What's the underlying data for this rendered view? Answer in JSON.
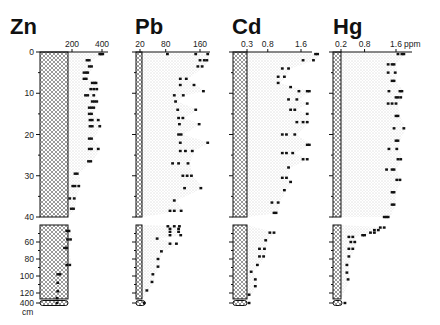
{
  "chart_data": {
    "type": "scatter",
    "title": "",
    "ylabel": "Depth (cm)",
    "y_axis": {
      "upper_section": {
        "range": [
          0,
          40
        ],
        "ticks": [
          0,
          10,
          20,
          30,
          40
        ],
        "minor_step": 5
      },
      "lower_section": {
        "range": [
          40,
          120
        ],
        "ticks": [
          60,
          80,
          100,
          120
        ],
        "minor_step": 10
      },
      "bottom_sample": {
        "depth": 400,
        "label": "400",
        "unit": "cm"
      }
    },
    "panels": [
      {
        "element": "Zn",
        "x_ticks": [
          "200",
          "400"
        ],
        "x_tick_values": [
          200,
          400
        ],
        "xlim": [
          0,
          420
        ],
        "background": 90,
        "points": [
          {
            "depth": 0.5,
            "values": [
              385,
              395,
              405
            ]
          },
          {
            "depth": 2,
            "values": [
              300,
              315
            ]
          },
          {
            "depth": 3.5,
            "values": [
              315,
              330
            ]
          },
          {
            "depth": 5,
            "values": [
              280,
              295,
              305
            ]
          },
          {
            "depth": 6.5,
            "values": [
              280,
              295
            ]
          },
          {
            "depth": 7.5,
            "values": [
              335,
              350,
              360
            ]
          },
          {
            "depth": 9,
            "values": [
              325,
              345,
              365
            ]
          },
          {
            "depth": 10.5,
            "values": [
              290,
              305,
              345
            ]
          },
          {
            "depth": 12,
            "values": [
              335,
              350,
              365
            ]
          },
          {
            "depth": 13.5,
            "values": [
              315,
              330,
              345
            ]
          },
          {
            "depth": 15,
            "values": [
              315,
              330
            ]
          },
          {
            "depth": 16.5,
            "values": [
              320,
              335,
              375
            ]
          },
          {
            "depth": 18,
            "values": [
              320,
              335,
              385
            ]
          },
          {
            "depth": 21,
            "values": [
              315,
              330
            ]
          },
          {
            "depth": 23.5,
            "values": [
              315,
              330,
              375
            ]
          },
          {
            "depth": 26.5,
            "values": [
              310,
              325
            ]
          },
          {
            "depth": 29.5,
            "values": [
              220,
              235
            ]
          },
          {
            "depth": 32.5,
            "values": [
              205,
              220,
              245
            ]
          },
          {
            "depth": 35.5,
            "values": [
              185,
              215
            ]
          },
          {
            "depth": 38,
            "values": [
              195,
              210
            ]
          },
          {
            "depth": 47,
            "values": [
              165,
              180
            ]
          },
          {
            "depth": 57,
            "values": [
              170,
              190
            ]
          },
          {
            "depth": 67,
            "values": [
              150,
              165
            ]
          },
          {
            "depth": 87,
            "values": [
              165,
              185
            ]
          },
          {
            "depth": 98,
            "values": [
              105,
              120
            ]
          },
          {
            "depth": 108,
            "values": [
              105
            ]
          },
          {
            "depth": 118,
            "values": [
              105
            ]
          },
          {
            "depth": 126,
            "values": [
              100
            ]
          },
          {
            "depth": 400,
            "values": [
              100
            ]
          }
        ]
      },
      {
        "element": "Pb",
        "x_ticks": [
          "20",
          "80",
          "160"
        ],
        "x_tick_values": [
          20,
          80,
          160
        ],
        "xlim": [
          0,
          190
        ],
        "background": 20,
        "points": [
          {
            "depth": 0.5,
            "values": [
              84,
              150,
              178
            ]
          },
          {
            "depth": 2,
            "values": [
              160,
              170,
              176
            ]
          },
          {
            "depth": 3.5,
            "values": [
              155,
              165
            ]
          },
          {
            "depth": 6.5,
            "values": [
              114,
              128
            ]
          },
          {
            "depth": 8,
            "values": [
              114,
              146
            ]
          },
          {
            "depth": 9.5,
            "values": [
              168
            ]
          },
          {
            "depth": 10.5,
            "values": [
              100,
              121
            ]
          },
          {
            "depth": 12,
            "values": [
              103
            ]
          },
          {
            "depth": 14,
            "values": [
              108,
              150
            ]
          },
          {
            "depth": 16,
            "values": [
              110,
              120
            ]
          },
          {
            "depth": 17.5,
            "values": [
              112,
              158
            ]
          },
          {
            "depth": 20,
            "values": [
              110,
              116
            ]
          },
          {
            "depth": 22,
            "values": [
              114,
              178
            ]
          },
          {
            "depth": 24,
            "values": [
              114,
              126,
              142
            ]
          },
          {
            "depth": 27,
            "values": [
              96,
              110,
              132
            ]
          },
          {
            "depth": 30,
            "values": [
              120,
              130,
              140
            ]
          },
          {
            "depth": 33,
            "values": [
              124,
              162
            ]
          },
          {
            "depth": 36,
            "values": [
              100
            ]
          },
          {
            "depth": 38.5,
            "values": [
              90,
              100,
              116
            ]
          },
          {
            "depth": 41.5,
            "values": [
              85,
              100,
              112
            ]
          },
          {
            "depth": 44.5,
            "values": [
              90,
              110
            ]
          },
          {
            "depth": 48,
            "values": [
              90,
              110
            ]
          },
          {
            "depth": 52,
            "values": [
              90,
              115
            ]
          },
          {
            "depth": 56,
            "values": [
              60
            ]
          },
          {
            "depth": 62,
            "values": [
              90,
              105
            ]
          },
          {
            "depth": 71,
            "values": [
              70
            ]
          },
          {
            "depth": 80,
            "values": [
              62
            ]
          },
          {
            "depth": 89,
            "values": [
              62
            ]
          },
          {
            "depth": 98,
            "values": [
              50
            ]
          },
          {
            "depth": 107,
            "values": [
              48
            ]
          },
          {
            "depth": 117,
            "values": [
              36
            ]
          },
          {
            "depth": 400,
            "values": [
              30
            ]
          }
        ]
      },
      {
        "element": "Cd",
        "x_ticks": [
          "0.3",
          "0.8",
          "1.6"
        ],
        "x_tick_values": [
          0.3,
          0.8,
          1.6
        ],
        "xlim": [
          0,
          2.0
        ],
        "background": 0.3,
        "points": [
          {
            "depth": 0.5,
            "values": [
              1.95,
              2.0
            ]
          },
          {
            "depth": 2,
            "values": [
              1.65,
              1.9
            ]
          },
          {
            "depth": 4,
            "values": [
              1.15,
              1.3
            ]
          },
          {
            "depth": 6,
            "values": [
              1.05,
              1.2
            ]
          },
          {
            "depth": 7.5,
            "values": [
              1.05
            ]
          },
          {
            "depth": 8.5,
            "values": [
              1.35
            ]
          },
          {
            "depth": 9.5,
            "values": [
              1.55,
              1.75,
              1.8
            ]
          },
          {
            "depth": 11.5,
            "values": [
              1.3,
              1.5
            ]
          },
          {
            "depth": 12.5,
            "values": [
              1.75
            ]
          },
          {
            "depth": 14,
            "values": [
              1.35,
              1.45
            ]
          },
          {
            "depth": 15,
            "values": [
              1.75
            ]
          },
          {
            "depth": 17,
            "values": [
              1.5,
              1.65,
              1.75
            ]
          },
          {
            "depth": 20,
            "values": [
              1.15,
              1.25,
              1.45
            ]
          },
          {
            "depth": 22.5,
            "values": [
              1.75,
              1.8
            ]
          },
          {
            "depth": 24.5,
            "values": [
              1.15,
              1.25,
              1.4
            ]
          },
          {
            "depth": 26,
            "values": [
              1.65,
              1.75
            ]
          },
          {
            "depth": 28,
            "values": [
              1.3
            ]
          },
          {
            "depth": 30.5,
            "values": [
              1.15,
              1.25
            ]
          },
          {
            "depth": 31.5,
            "values": [
              1.35
            ]
          },
          {
            "depth": 33.5,
            "values": [
              1.2
            ]
          },
          {
            "depth": 36.5,
            "values": [
              0.9,
              1.05
            ]
          },
          {
            "depth": 39,
            "values": [
              0.95,
              1.0
            ]
          },
          {
            "depth": 49,
            "values": [
              0.85,
              0.95
            ]
          },
          {
            "depth": 58,
            "values": [
              0.75
            ]
          },
          {
            "depth": 68,
            "values": [
              0.6,
              0.72
            ]
          },
          {
            "depth": 77,
            "values": [
              0.6,
              0.7
            ]
          },
          {
            "depth": 87,
            "values": [
              0.55
            ]
          },
          {
            "depth": 95,
            "values": [
              0.4
            ]
          },
          {
            "depth": 104,
            "values": [
              0.5
            ]
          },
          {
            "depth": 112,
            "values": [
              0.5
            ]
          },
          {
            "depth": 122,
            "values": [
              0.35
            ]
          },
          {
            "depth": 400,
            "values": [
              0.35
            ]
          }
        ]
      },
      {
        "element": "Hg",
        "x_ticks": [
          "0.2",
          "0.8",
          "1.6"
        ],
        "x_unit": "ppm",
        "x_tick_values": [
          0.2,
          0.8,
          1.6
        ],
        "xlim": [
          0,
          1.9
        ],
        "background": 0.2,
        "points": [
          {
            "depth": 0.5,
            "values": [
              1.65,
              1.75,
              1.8
            ]
          },
          {
            "depth": 3,
            "values": [
              1.4,
              1.5,
              1.55
            ]
          },
          {
            "depth": 5,
            "values": [
              1.4,
              1.58
            ]
          },
          {
            "depth": 7,
            "values": [
              1.5,
              1.55
            ]
          },
          {
            "depth": 9.5,
            "values": [
              1.42,
              1.7,
              1.75
            ]
          },
          {
            "depth": 11,
            "values": [
              1.6,
              1.65,
              1.72
            ]
          },
          {
            "depth": 12.5,
            "values": [
              1.4,
              1.5,
              1.6
            ]
          },
          {
            "depth": 15.5,
            "values": [
              1.6,
              1.65
            ]
          },
          {
            "depth": 18.5,
            "values": [
              1.55,
              1.8
            ]
          },
          {
            "depth": 21.5,
            "values": [
              1.6,
              1.65
            ]
          },
          {
            "depth": 23.5,
            "values": [
              1.42,
              1.62
            ]
          },
          {
            "depth": 26,
            "values": [
              1.65,
              1.72
            ]
          },
          {
            "depth": 28.5,
            "values": [
              1.36,
              1.5,
              1.55
            ]
          },
          {
            "depth": 31,
            "values": [
              1.62,
              1.7
            ]
          },
          {
            "depth": 34,
            "values": [
              1.5,
              1.55
            ]
          },
          {
            "depth": 37,
            "values": [
              1.5,
              1.55
            ]
          },
          {
            "depth": 40,
            "values": [
              1.3,
              1.35,
              1.4
            ]
          },
          {
            "depth": 43,
            "values": [
              1.2,
              1.3
            ]
          },
          {
            "depth": 46,
            "values": [
              1.05,
              1.15
            ]
          },
          {
            "depth": 49,
            "values": [
              0.95,
              1.05
            ]
          },
          {
            "depth": 52,
            "values": [
              0.75,
              0.8
            ]
          },
          {
            "depth": 54,
            "values": [
              0.4,
              0.5
            ]
          },
          {
            "depth": 60,
            "values": [
              0.45,
              0.55
            ]
          },
          {
            "depth": 68,
            "values": [
              0.4,
              0.5
            ]
          },
          {
            "depth": 77,
            "values": [
              0.4
            ]
          },
          {
            "depth": 87,
            "values": [
              0.35
            ]
          },
          {
            "depth": 96,
            "values": [
              0.35
            ]
          },
          {
            "depth": 104,
            "values": [
              0.38
            ]
          },
          {
            "depth": 400,
            "values": [
              0.3
            ]
          }
        ]
      }
    ],
    "layout": {
      "grid": false,
      "legend": "none",
      "x_axis_position": "top",
      "y_axis_inverted": true
    }
  },
  "labels": {
    "depth_ticks_upper": [
      "0",
      "10",
      "20",
      "30",
      "40"
    ],
    "depth_ticks_lower": [
      "60",
      "80",
      "100",
      "120"
    ],
    "bottom_depth": "400",
    "bottom_unit": "cm"
  }
}
